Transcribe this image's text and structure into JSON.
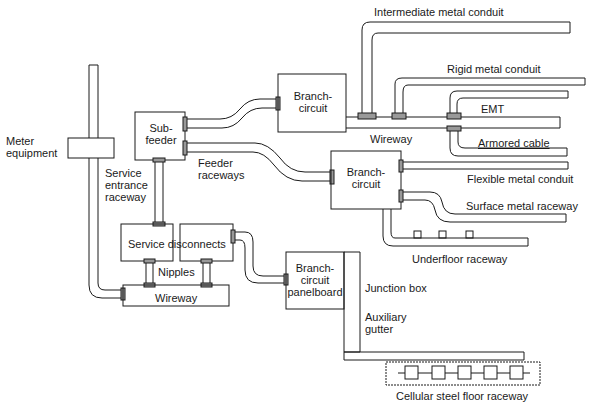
{
  "diagram": {
    "type": "raceway-system",
    "labels": {
      "meter_equipment": [
        "Meter",
        "equipment"
      ],
      "sub_feeder": [
        "Sub-",
        "feeder"
      ],
      "service_entrance_raceway": [
        "Service",
        "entrance",
        "raceway"
      ],
      "feeder_raceways": [
        "Feeder",
        "raceways"
      ],
      "branch_circuit_top": [
        "Branch-",
        "circuit"
      ],
      "branch_circuit_mid": [
        "Branch-",
        "circuit"
      ],
      "branch_circuit_panelboard": [
        "Branch-",
        "circuit",
        "panelboard"
      ],
      "service_disconnects": "Service disconnects",
      "nipples": "Nipples",
      "wireway_bottom": "Wireway",
      "wireway_top": "Wireway",
      "intermediate_metal_conduit": "Intermediate metal conduit",
      "rigid_metal_conduit": "Rigid metal conduit",
      "emt": "EMT",
      "armored_cable": "Armored cable",
      "flexible_metal_conduit": "Flexible metal conduit",
      "surface_metal_raceway": "Surface metal raceway",
      "underfloor_raceway": "Underfloor raceway",
      "junction_box": "Junction box",
      "auxiliary_gutter": [
        "Auxiliary",
        "gutter"
      ],
      "cellular_steel_floor_raceway": "Cellular steel floor raceway"
    },
    "colors": {
      "line": "#1a1a1a",
      "background": "#ffffff",
      "fitting": "#555555"
    }
  }
}
